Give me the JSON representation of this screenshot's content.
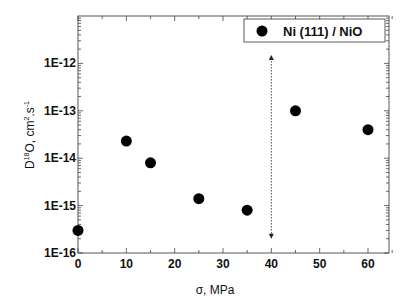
{
  "chart_data": {
    "type": "scatter",
    "title": "",
    "xlabel": "σ, MPa",
    "ylabel": "D18O, cm2.s-1",
    "ylabel_parts": {
      "main": "D",
      "sup1": "18",
      "mid": "O, cm",
      "sup2": "2",
      "mid2": ".s",
      "sup3": "-1"
    },
    "xlim": [
      -1,
      67
    ],
    "ylim": [
      1e-16,
      1e-11
    ],
    "yscale": "log",
    "x_ticks": [
      0,
      10,
      20,
      30,
      40,
      50,
      60
    ],
    "x_tick_labels": [
      "0",
      "10",
      "20",
      "30",
      "40",
      "50",
      "60"
    ],
    "y_ticks": [
      1e-16,
      1e-15,
      1e-14,
      1e-13,
      1e-12
    ],
    "y_tick_labels": [
      "1E-16",
      "1E-15",
      "1E-14",
      "1E-13",
      "1E-12"
    ],
    "grid": false,
    "legend_position": "upper right",
    "series": [
      {
        "name": "Ni (111) / NiO",
        "marker": "filled-circle",
        "color": "#000000",
        "x": [
          0,
          10,
          15,
          25,
          35,
          45,
          60
        ],
        "y": [
          3e-16,
          2.3e-14,
          8e-15,
          1.4e-15,
          8e-16,
          1e-13,
          4e-14
        ]
      }
    ],
    "annotations": [
      {
        "type": "double-arrow-dotted",
        "x": 40,
        "y_from": 2e-16,
        "y_to": 1.5e-12
      }
    ]
  }
}
